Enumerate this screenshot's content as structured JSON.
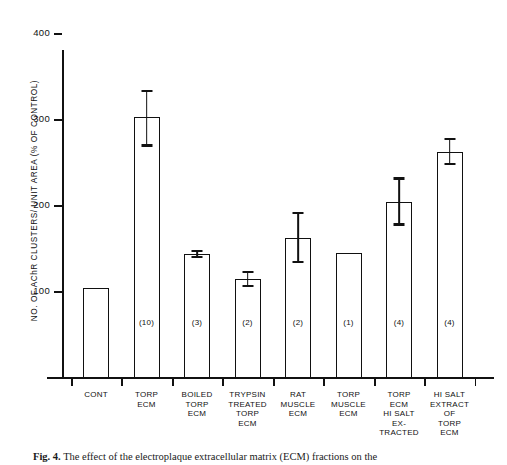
{
  "figure": {
    "caption_label": "Fig. 4.",
    "caption_text": "The effect of the electroplaque extracellular matrix (ECM) fractions on the"
  },
  "chart_data": {
    "type": "bar",
    "title": "",
    "xlabel": "",
    "ylabel": "NO. OF AChR CLUSTERS/ UNIT AREA (% OF CONTROL)",
    "ylim": [
      0,
      440
    ],
    "yticks": [
      100,
      200,
      300,
      400
    ],
    "ytick_labels": [
      "100",
      "200",
      "300",
      "400"
    ],
    "grid": false,
    "legend": "none",
    "categories": [
      "CONT",
      "TORP ECM",
      "BOILED TORP ECM",
      "TRYPSIN TREATED TORP ECM",
      "RAT MUSCLE ECM",
      "TORP MUSCLE ECM",
      "TORP ECM HI SALT EX- TRACTED",
      "HI SALT EXTRACT OF TORP ECM"
    ],
    "category_lines": [
      [
        "CONT"
      ],
      [
        "TORP",
        "ECM"
      ],
      [
        "BOILED",
        "TORP",
        "ECM"
      ],
      [
        "TRYPSIN",
        "TREATED",
        "TORP",
        "ECM"
      ],
      [
        "RAT",
        "MUSCLE",
        "ECM"
      ],
      [
        "TORP",
        "MUSCLE",
        "ECM"
      ],
      [
        "TORP",
        "ECM",
        "HI SALT",
        "EX-",
        "TRACTED"
      ],
      [
        "HI SALT",
        "EXTRACT",
        "OF",
        "TORP",
        "ECM"
      ]
    ],
    "values": [
      103,
      302,
      143,
      114,
      162,
      144,
      204,
      262
    ],
    "err_upper": [
      null,
      334,
      148,
      123,
      192,
      null,
      232,
      278
    ],
    "err_lower": [
      null,
      268,
      138,
      105,
      132,
      null,
      176,
      246
    ],
    "n_labels": [
      "",
      "(10)",
      "(3)",
      "(2)",
      "(2)",
      "(1)",
      "(4)",
      "(4)"
    ],
    "n_values": [
      null,
      10,
      3,
      2,
      2,
      1,
      4,
      4
    ],
    "bar_color": "#ffffff",
    "line_color": "#111111"
  }
}
